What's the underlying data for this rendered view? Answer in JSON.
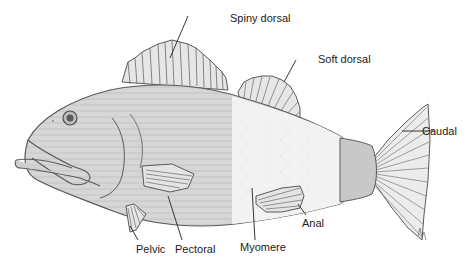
{
  "diagram": {
    "labels": {
      "spiny_dorsal": "Spiny dorsal",
      "soft_dorsal": "Soft dorsal",
      "caudal": "Caudal",
      "anal": "Anal",
      "myomere": "Myomere",
      "pectoral": "Pectoral",
      "pelvic": "Pelvic"
    },
    "colors": {
      "outline": "#5a5a5a",
      "body_fill": "#d9d9d9",
      "myomere_fill": "#f2f2f2",
      "peduncle_fill": "#c8c8c8",
      "fin_fill": "#e6e6e6",
      "leader_line": "#222222"
    }
  }
}
